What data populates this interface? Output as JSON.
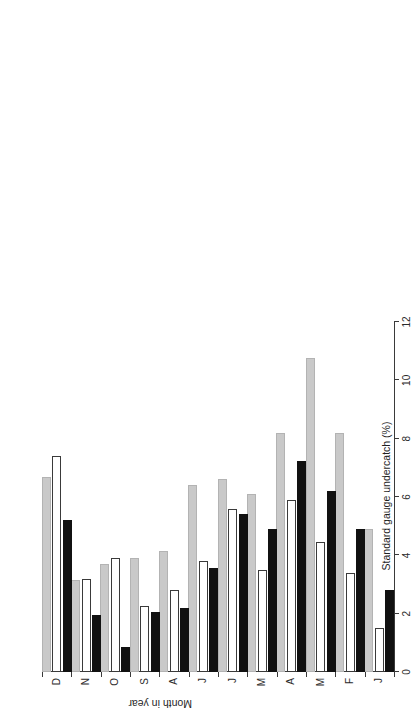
{
  "chart_data": {
    "type": "bar",
    "orientation": "horizontal",
    "title": "",
    "xlabel": "Standard gauge undercatch (%)",
    "ylabel": "Month in year",
    "categories": [
      "J",
      "F",
      "M",
      "A",
      "M",
      "J",
      "J",
      "A",
      "S",
      "O",
      "N",
      "D"
    ],
    "xlim": [
      0,
      12
    ],
    "xticks": [
      0,
      2,
      4,
      6,
      8,
      10,
      12
    ],
    "xtick_labels": [
      "0",
      "2",
      "4",
      "6",
      "8",
      "10",
      "12"
    ],
    "grid": false,
    "legend": "none",
    "series": [
      {
        "name": "series-1",
        "color": "#111111",
        "style": "black-filled",
        "values": [
          2.8,
          4.9,
          6.2,
          7.25,
          4.9,
          5.4,
          3.55,
          2.2,
          2.05,
          0.85,
          1.95,
          5.2
        ]
      },
      {
        "name": "series-2",
        "color": "#ffffff",
        "style": "white-open",
        "values": [
          1.5,
          3.4,
          4.45,
          5.9,
          3.5,
          5.6,
          3.8,
          2.8,
          2.25,
          3.9,
          3.2,
          7.4
        ]
      },
      {
        "name": "series-3",
        "color": "#c9c9c9",
        "style": "gray-filled",
        "values": [
          4.9,
          8.2,
          10.75,
          8.2,
          6.1,
          6.6,
          6.4,
          4.15,
          3.9,
          3.7,
          3.14,
          6.7
        ]
      }
    ]
  },
  "figure": {
    "background": "#ffffff",
    "axis_color": "#3a3a3a"
  }
}
